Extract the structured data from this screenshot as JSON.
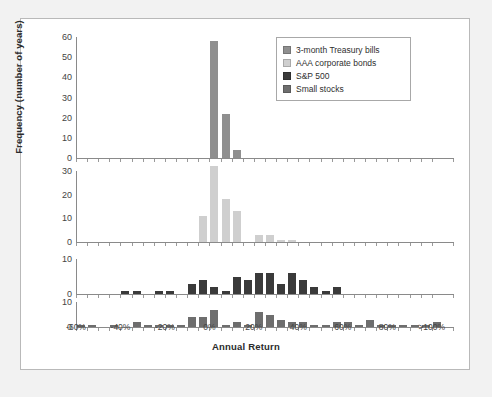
{
  "figure": {
    "background_color": "#f2f2f2",
    "panel_color": "#ffffff",
    "border_color": "#b9b9b9"
  },
  "legend": {
    "position": "top-right",
    "items": [
      {
        "label": "3-month Treasury bills",
        "color": "#8f8f8f"
      },
      {
        "label": "AAA corporate bonds",
        "color": "#cfcfcf"
      },
      {
        "label": "S&P 500",
        "color": "#3a3a3a"
      },
      {
        "label": "Small stocks",
        "color": "#6e6e6e"
      }
    ]
  },
  "chart_data": {
    "type": "bar",
    "title": "",
    "xlabel": "Annual Return",
    "ylabel": "Frequency (number of years)",
    "grid": false,
    "legend_position": "top-right",
    "xlim": [
      -60,
      110
    ],
    "bin_width": 5,
    "x_tick_labels": [
      "-60%",
      "-40%",
      "-20%",
      "0%",
      "20%",
      "40%",
      "60%",
      "80%",
      ">100%"
    ],
    "x_tick_values": [
      -60,
      -40,
      -20,
      0,
      20,
      40,
      60,
      80,
      100
    ],
    "panels": [
      {
        "name": "3-month Treasury bills",
        "color": "#8f8f8f",
        "ylim": [
          0,
          60
        ],
        "y_ticks": [
          0,
          10,
          20,
          30,
          40,
          50,
          60
        ],
        "bins": [
          -60,
          -55,
          -50,
          -45,
          -40,
          -35,
          -30,
          -25,
          -20,
          -15,
          -10,
          -5,
          0,
          5,
          10,
          15,
          20,
          25,
          30,
          35,
          40,
          45,
          50,
          55,
          60,
          65,
          70,
          75,
          80,
          85,
          90,
          95,
          100
        ],
        "values": [
          0,
          0,
          0,
          0,
          0,
          0,
          0,
          0,
          0,
          0,
          0,
          0,
          58,
          22,
          4,
          0,
          0,
          0,
          0,
          0,
          0,
          0,
          0,
          0,
          0,
          0,
          0,
          0,
          0,
          0,
          0,
          0,
          0
        ]
      },
      {
        "name": "AAA corporate bonds",
        "color": "#cfcfcf",
        "ylim": [
          0,
          30
        ],
        "y_ticks": [
          0,
          10,
          20,
          30
        ],
        "bins": [
          -60,
          -55,
          -50,
          -45,
          -40,
          -35,
          -30,
          -25,
          -20,
          -15,
          -10,
          -5,
          0,
          5,
          10,
          15,
          20,
          25,
          30,
          35,
          40,
          45,
          50,
          55,
          60,
          65,
          70,
          75,
          80,
          85,
          90,
          95,
          100
        ],
        "values": [
          0,
          0,
          0,
          0,
          0,
          0,
          0,
          0,
          0,
          0,
          0,
          11,
          32,
          18,
          13,
          0,
          3,
          3,
          1,
          1,
          0,
          0,
          0,
          0,
          0,
          0,
          0,
          0,
          0,
          0,
          0,
          0,
          0
        ]
      },
      {
        "name": "S&P 500",
        "color": "#3a3a3a",
        "ylim": [
          0,
          10
        ],
        "y_ticks": [
          0,
          10
        ],
        "bins": [
          -60,
          -55,
          -50,
          -45,
          -40,
          -35,
          -30,
          -25,
          -20,
          -15,
          -10,
          -5,
          0,
          5,
          10,
          15,
          20,
          25,
          30,
          35,
          40,
          45,
          50,
          55,
          60,
          65,
          70,
          75,
          80,
          85,
          90,
          95,
          100
        ],
        "values": [
          0,
          0,
          0,
          0,
          1,
          1,
          0,
          1,
          1,
          0,
          3,
          4,
          2,
          1,
          5,
          4,
          6,
          6,
          3,
          6,
          4,
          2,
          1,
          2,
          0,
          0,
          0,
          0,
          0,
          0,
          0,
          0,
          0
        ]
      },
      {
        "name": "Small stocks",
        "color": "#6e6e6e",
        "ylim": [
          0,
          10
        ],
        "y_ticks": [
          0,
          10
        ],
        "bins": [
          -60,
          -55,
          -50,
          -45,
          -40,
          -35,
          -30,
          -25,
          -20,
          -15,
          -10,
          -5,
          0,
          5,
          10,
          15,
          20,
          25,
          30,
          35,
          40,
          45,
          50,
          55,
          60,
          65,
          70,
          75,
          80,
          85,
          90,
          95,
          100
        ],
        "values": [
          1,
          1,
          0,
          1,
          0,
          2,
          1,
          1,
          1,
          1,
          4,
          4,
          7,
          1,
          2,
          1,
          6,
          5,
          3,
          2,
          2,
          1,
          1,
          2,
          2,
          1,
          3,
          1,
          1,
          1,
          1,
          1,
          2
        ]
      }
    ]
  }
}
